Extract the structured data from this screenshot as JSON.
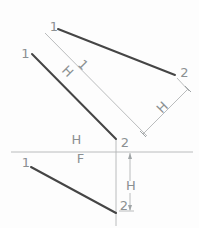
{
  "figure": {
    "colors": {
      "background": "#fdfdfd",
      "object_line": "#454545",
      "construction_line": "#b2b4b5",
      "dimension_line": "#9fa4a6",
      "label_text": "#8b9092"
    },
    "object_lines": [
      {
        "name": "auxiliary-view-line-12",
        "x1": 58,
        "y1": 29,
        "x2": 175,
        "y2": 75
      },
      {
        "name": "top-view-line-12",
        "x1": 32,
        "y1": 54,
        "x2": 116,
        "y2": 139
      },
      {
        "name": "front-view-line-12",
        "x1": 31,
        "y1": 167,
        "x2": 116,
        "y2": 213
      }
    ],
    "construction_lines": [
      {
        "name": "auxiliary-fold-line",
        "x1": 45,
        "y1": 33,
        "x2": 147,
        "y2": 136
      },
      {
        "name": "hf-fold-line",
        "x1": 11,
        "y1": 152,
        "x2": 193,
        "y2": 152
      },
      {
        "name": "projection-line-point2",
        "x1": 116,
        "y1": 139,
        "x2": 116,
        "y2": 226
      },
      {
        "name": "extension-line-point2-aux",
        "x1": 177,
        "y1": 78,
        "x2": 189,
        "y2": 91
      },
      {
        "name": "aux-dimension-line-H",
        "x1": 143,
        "y1": 134,
        "x2": 188,
        "y2": 89
      },
      {
        "name": "front-dimension-line-H-upper",
        "x1": 130,
        "y1": 153,
        "x2": 130,
        "y2": 181
      },
      {
        "name": "front-dimension-line-H-lower",
        "x1": 130,
        "y1": 193,
        "x2": 130,
        "y2": 210
      },
      {
        "name": "point2-height-reference-tick",
        "x1": 119,
        "y1": 211,
        "x2": 134,
        "y2": 211
      }
    ],
    "ticks": [
      {
        "name": "aux-dimension-tick-upper",
        "x1": 185,
        "y1": 86,
        "x2": 191,
        "y2": 92
      },
      {
        "name": "aux-dimension-tick-lower",
        "x1": 140,
        "y1": 131,
        "x2": 146,
        "y2": 137
      }
    ],
    "arrows": [
      {
        "name": "front-dimension-arrow-up",
        "x": 130,
        "y": 153,
        "dir": "up"
      },
      {
        "name": "front-dimension-arrow-down",
        "x": 130,
        "y": 211,
        "dir": "down"
      }
    ],
    "labels": [
      {
        "name": "aux-view-point1-label",
        "text": "1",
        "x": 54,
        "y": 31,
        "rotate": 0,
        "dy": 0
      },
      {
        "name": "aux-view-point2-label",
        "text": "2",
        "x": 184.5,
        "y": 77,
        "rotate": 0,
        "dy": 0
      },
      {
        "name": "top-view-point1-label",
        "text": "1",
        "x": 25.5,
        "y": 58,
        "rotate": 0,
        "dy": 0
      },
      {
        "name": "top-view-point2-label",
        "text": "2",
        "x": 125,
        "y": 147,
        "rotate": 0,
        "dy": 0
      },
      {
        "name": "front-view-point1-label",
        "text": "1",
        "x": 26,
        "y": 167,
        "rotate": 0,
        "dy": 0
      },
      {
        "name": "front-view-point2-label",
        "text": "2",
        "x": 124,
        "y": 210,
        "rotate": 0,
        "dy": 0
      },
      {
        "name": "hf-fold-label-h",
        "text": "H",
        "x": 76.5,
        "y": 144,
        "rotate": 0,
        "dy": 0
      },
      {
        "name": "hf-fold-label-f",
        "text": "F",
        "x": 80.5,
        "y": 163,
        "rotate": 0,
        "dy": 0
      },
      {
        "name": "front-dimension-label-h",
        "text": "H",
        "x": 131,
        "y": 190,
        "rotate": 0,
        "dy": 0
      },
      {
        "name": "aux-dimension-label-h",
        "text": "H",
        "x": 162,
        "y": 107,
        "rotate": -45,
        "dy": 5
      },
      {
        "name": "aux-fold-label-h",
        "text": "H",
        "x": 68,
        "y": 71,
        "rotate": 45,
        "dy": 5
      },
      {
        "name": "aux-fold-label-1",
        "text": "1",
        "x": 83.5,
        "y": 64.5,
        "rotate": 45,
        "dy": 5
      }
    ]
  }
}
